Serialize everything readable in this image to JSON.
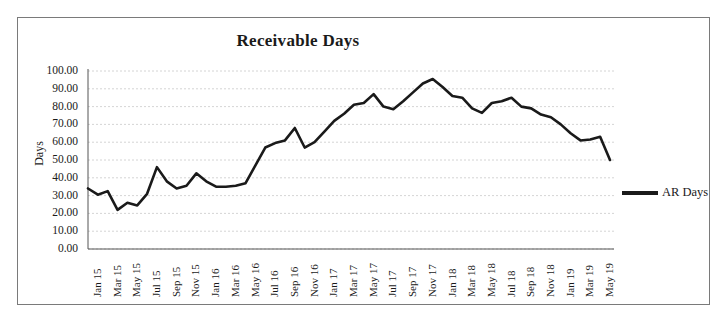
{
  "chart_data": {
    "type": "line",
    "title": "Receivable Days",
    "xlabel": "",
    "ylabel": "Days",
    "ylim": [
      0,
      100
    ],
    "ytick_labels": [
      "100.00",
      "90.00",
      "80.00",
      "70.00",
      "60.00",
      "50.00",
      "40.00",
      "30.00",
      "20.00",
      "10.00",
      "0.00"
    ],
    "ytick_values": [
      100,
      90,
      80,
      70,
      60,
      50,
      40,
      30,
      20,
      10,
      0
    ],
    "grid": true,
    "legend_position": "right",
    "line_color": "#1a1a1a",
    "xtick_labels": [
      "Jan 15",
      "Mar 15",
      "May 15",
      "Jul 15",
      "Sep 15",
      "Nov 15",
      "Jan 16",
      "Mar 16",
      "May 16",
      "Jul 16",
      "Sep 16",
      "Nov 16",
      "Jan 17",
      "Mar 17",
      "May 17",
      "Jul 17",
      "Sep 17",
      "Nov 17",
      "Jan 18",
      "Mar 18",
      "May 18",
      "Jul 18",
      "Sep 18",
      "Nov 18",
      "Jan 19",
      "Mar 19",
      "May 19"
    ],
    "series": [
      {
        "name": "AR Days",
        "x": [
          "Jan 15",
          "Feb 15",
          "Mar 15",
          "Apr 15",
          "May 15",
          "Jun 15",
          "Jul 15",
          "Aug 15",
          "Sep 15",
          "Oct 15",
          "Nov 15",
          "Dec 15",
          "Jan 16",
          "Feb 16",
          "Mar 16",
          "Apr 16",
          "May 16",
          "Jun 16",
          "Jul 16",
          "Aug 16",
          "Sep 16",
          "Oct 16",
          "Nov 16",
          "Dec 16",
          "Jan 17",
          "Feb 17",
          "Mar 17",
          "Apr 17",
          "May 17",
          "Jun 17",
          "Jul 17",
          "Aug 17",
          "Sep 17",
          "Oct 17",
          "Nov 17",
          "Dec 17",
          "Jan 18",
          "Feb 18",
          "Mar 18",
          "Apr 18",
          "May 18",
          "Jun 18",
          "Jul 18",
          "Aug 18",
          "Sep 18",
          "Oct 18",
          "Nov 18",
          "Dec 18",
          "Jan 19",
          "Feb 19",
          "Mar 19",
          "Apr 19",
          "May 19",
          "Jun 19"
        ],
        "values": [
          34,
          30.5,
          32.5,
          22,
          26,
          24.5,
          31,
          46,
          38,
          34,
          35.5,
          42.5,
          38,
          35,
          35,
          35.5,
          37,
          47,
          57,
          59.5,
          61,
          68,
          57,
          60,
          66,
          72,
          76,
          81,
          82,
          87,
          80,
          78.5,
          83,
          88,
          93,
          95.5,
          91,
          86,
          85,
          79,
          76.5,
          82,
          83,
          85,
          80,
          79,
          75.5,
          74,
          70,
          65,
          61,
          61.5,
          63,
          50
        ]
      }
    ]
  },
  "legend": {
    "entries": [
      {
        "label": "AR Days"
      }
    ]
  }
}
